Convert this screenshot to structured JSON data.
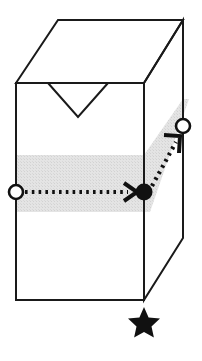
{
  "figure": {
    "background_color": "#ffffff",
    "line_color": "#1a1a1a",
    "band_color": "#e2e2e2",
    "marker_fill_open": "#ffffff",
    "marker_fill_solid": "#111111",
    "caption": "",
    "shapes": {
      "box": {
        "name": "rectangular-box",
        "front_face": {
          "top_left": [
            16,
            83
          ],
          "top_right": [
            144,
            83
          ],
          "bottom_right": [
            144,
            300
          ],
          "bottom_left": [
            16,
            300
          ]
        },
        "top_face": {
          "front_left": [
            16,
            83
          ],
          "back_left": [
            58,
            20
          ],
          "back_right": [
            183,
            20
          ],
          "front_right": [
            144,
            83
          ]
        },
        "right_face": {
          "front_top": [
            144,
            83
          ],
          "back_top": [
            183,
            20
          ],
          "back_bottom": [
            183,
            238
          ],
          "front_bottom": [
            144,
            300
          ]
        }
      },
      "notch": {
        "name": "v-notch",
        "points": [
          [
            48,
            83
          ],
          [
            78,
            117
          ],
          [
            108,
            83
          ]
        ]
      },
      "band_front": {
        "name": "highlight-band-front",
        "points": [
          [
            16,
            155
          ],
          [
            144,
            155
          ],
          [
            144,
            212
          ],
          [
            16,
            212
          ]
        ]
      },
      "band_right": {
        "name": "highlight-band-right",
        "points": [
          [
            144,
            155
          ],
          [
            183,
            99
          ],
          [
            183,
            155
          ],
          [
            144,
            212
          ]
        ]
      },
      "star": {
        "name": "star-marker",
        "center": [
          144,
          322
        ],
        "radius": 14,
        "points": 5
      }
    },
    "markers": [
      {
        "name": "start-node",
        "style": "open-circle",
        "position": [
          16,
          192
        ],
        "radius": 7
      },
      {
        "name": "waypoint-node",
        "style": "filled-circle",
        "position": [
          144,
          192
        ],
        "radius": 8
      },
      {
        "name": "end-node",
        "style": "open-circle",
        "position": [
          183,
          126
        ],
        "radius": 7
      }
    ],
    "paths": [
      {
        "name": "horizontal-dotted-arrow",
        "style": "dotted",
        "from": [
          25,
          192
        ],
        "to": [
          135,
          192
        ],
        "arrowhead": "open-chevron"
      },
      {
        "name": "diagonal-dotted-arrow",
        "style": "dotted",
        "from": [
          152,
          186
        ],
        "to": [
          180,
          136
        ],
        "arrowhead": "open-chevron"
      }
    ]
  }
}
